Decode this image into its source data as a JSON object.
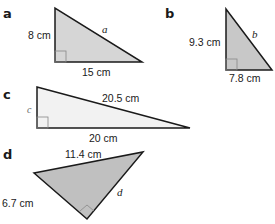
{
  "colors": {
    "fill_dark": "#c8c8c8",
    "fill_medium": "#d6d6d6",
    "fill_light": "#f0f0f0",
    "stroke": "#1a1a1a",
    "right_angle": "#888888"
  },
  "triangles": [
    {
      "label": "a",
      "vertical_side": "8 cm",
      "horizontal_side": "15 cm",
      "hypotenuse": "a"
    },
    {
      "label": "b",
      "vertical_side": "9.3 cm",
      "horizontal_side": "7.8 cm",
      "hypotenuse": "b"
    },
    {
      "label": "c",
      "vertical_side": "c",
      "horizontal_side": "20 cm",
      "hypotenuse": "20.5 cm"
    },
    {
      "label": "d",
      "top_side": "11.4 cm",
      "left_side": "6.7 cm",
      "right_side": "d"
    }
  ]
}
